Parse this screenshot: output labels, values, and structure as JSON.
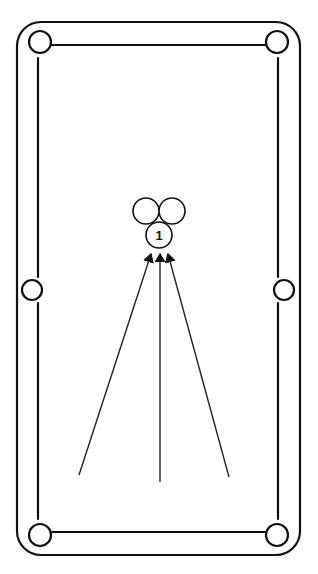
{
  "diagram": {
    "pockets": [
      "top-left",
      "top-right",
      "middle-left",
      "middle-right",
      "bottom-left",
      "bottom-right"
    ],
    "balls": [
      {
        "id": "rear-left",
        "label": ""
      },
      {
        "id": "rear-right",
        "label": ""
      },
      {
        "id": "head",
        "label": "1"
      }
    ],
    "arrows": [
      {
        "id": "left-shot",
        "target": "head"
      },
      {
        "id": "center-shot",
        "target": "head"
      },
      {
        "id": "right-shot",
        "target": "head"
      }
    ],
    "colors": {
      "line": "#111111",
      "background": "#ffffff"
    }
  }
}
